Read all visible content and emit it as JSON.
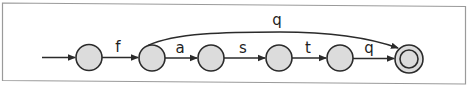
{
  "diagram": {
    "type": "finite-automaton",
    "colors": {
      "state_fill": "#dcdcdc",
      "stroke": "#2b2b2b",
      "frame": "#9a9a9a",
      "background": "#ffffff"
    },
    "states": [
      {
        "id": "s0",
        "initial": true,
        "accepting": false
      },
      {
        "id": "s1",
        "initial": false,
        "accepting": false
      },
      {
        "id": "s2",
        "initial": false,
        "accepting": false
      },
      {
        "id": "s3",
        "initial": false,
        "accepting": false
      },
      {
        "id": "s4",
        "initial": false,
        "accepting": false
      },
      {
        "id": "s5",
        "initial": false,
        "accepting": true
      }
    ],
    "transitions": [
      {
        "from": "s0",
        "to": "s1",
        "label": "f"
      },
      {
        "from": "s1",
        "to": "s2",
        "label": "a"
      },
      {
        "from": "s2",
        "to": "s3",
        "label": "s"
      },
      {
        "from": "s3",
        "to": "s4",
        "label": "t"
      },
      {
        "from": "s4",
        "to": "s5",
        "label": "q"
      },
      {
        "from": "s1",
        "to": "s5",
        "label": "q"
      }
    ]
  }
}
